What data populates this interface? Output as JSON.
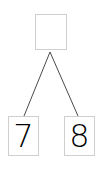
{
  "diagram": {
    "type": "number-bond",
    "whole": {
      "value": ""
    },
    "parts": [
      {
        "value": "7"
      },
      {
        "value": "8"
      }
    ],
    "colors": {
      "line": "#4a4a4a",
      "box_border": "#cfcfcf",
      "text": "#000000"
    }
  }
}
